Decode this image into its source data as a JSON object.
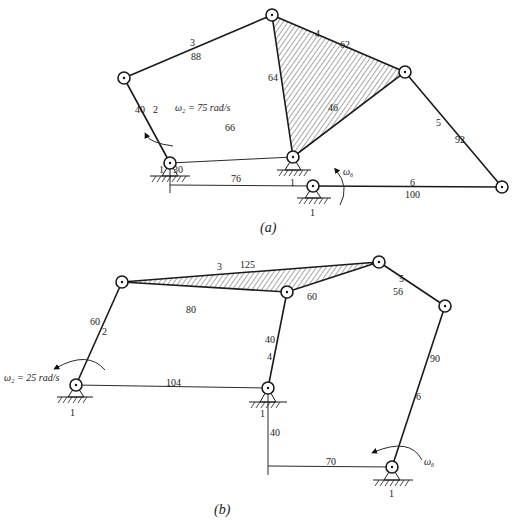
{
  "figure_a": {
    "caption": "(a)",
    "links": [
      {
        "id": "2",
        "length": "40"
      },
      {
        "id": "3",
        "length": "88"
      },
      {
        "id": "4",
        "sides": [
          "62",
          "64",
          "46"
        ]
      },
      {
        "id": "5",
        "length": "92"
      },
      {
        "id": "6",
        "length": "100"
      }
    ],
    "labels": {
      "link2_id": "2",
      "link2_len": "40",
      "link3_id": "3",
      "link3_len": "88",
      "link4_id": "4",
      "link4_top": "62",
      "link4_left": "64",
      "link4_bottom": "46",
      "link5_id": "5",
      "link5_len": "92",
      "link6_id": "6",
      "link6_len": "100",
      "ground_dist": "66",
      "offset_v": "30",
      "offset_h": "76",
      "ground1a": "1",
      "ground1b": "1",
      "ground1c": "1",
      "omega_input": "ω₂ = 75 rad/s",
      "omega_output": "ω₆"
    }
  },
  "figure_b": {
    "caption": "(b)",
    "labels": {
      "link2_id": "2",
      "link2_len": "60",
      "link3_id": "3",
      "link3_top": "125",
      "link3_left": "80",
      "link3_right": "60",
      "link4_id": "4",
      "link4_len": "40",
      "link5_id": "5",
      "link5_len": "56",
      "link6_id": "6",
      "link6_len": "90",
      "ground_dist": "104",
      "offset_v": "40",
      "offset_h": "70",
      "ground1a": "1",
      "ground1b": "1",
      "ground1c": "1",
      "omega_input": "ω₂ = 25 rad/s",
      "omega_output": "ω₆"
    }
  }
}
